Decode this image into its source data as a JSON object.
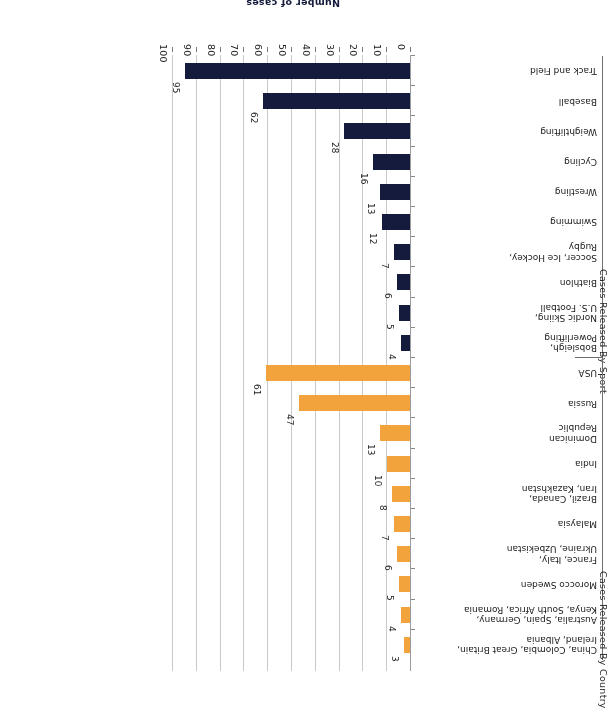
{
  "axis": {
    "value_axis_title": "Number of cases",
    "value_ticks": [
      "0",
      "10",
      "20",
      "30",
      "40",
      "50",
      "60",
      "70",
      "80",
      "90",
      "100"
    ],
    "value_min": 0,
    "value_max": 100
  },
  "groups": [
    {
      "id": "sport",
      "title": "Cases Released By Sport",
      "color": "#141b3c"
    },
    {
      "id": "country",
      "title": "Cases Released By Country",
      "color": "#f2a33c"
    }
  ],
  "chart_data": {
    "type": "bar",
    "orientation": "horizontal",
    "title": "",
    "xlabel": "Number of cases",
    "ylabel": "",
    "xlim": [
      0,
      100
    ],
    "grid": true,
    "legend": "none",
    "tick_labels": [
      "0",
      "10",
      "20",
      "30",
      "40",
      "50",
      "60",
      "70",
      "80",
      "90",
      "100"
    ],
    "series": [
      {
        "name": "Cases Released By Sport",
        "color": "#141b3c",
        "categories": [
          "Track and Field",
          "Baseball",
          "Weightlifting",
          "Cycling",
          "Wrestling",
          "Swimming",
          "Soccer, Ice Hockey,\nRugby",
          "Biathlon",
          "Nordic Skiing,\nU.S. Football",
          "Bobsleigh,\nPowerlifting"
        ],
        "values": [
          95,
          62,
          28,
          16,
          13,
          12,
          7,
          6,
          5,
          4
        ],
        "labels": [
          "95",
          "62",
          "28",
          "16",
          "13",
          "12",
          "7",
          "6",
          "5",
          "4"
        ]
      },
      {
        "name": "Cases Released By Country",
        "color": "#f2a33c",
        "categories": [
          "USA",
          "Russia",
          "Dominican\nRepublic",
          "India",
          "Brazil, Canada,\nIran, Kazakhstan",
          "Malaysia",
          "France, Italy,\nUkraine, Uzbekistan",
          "Morocco Sweden",
          "Australia, Spain, Germany,\nKenya, South Africa, Romania",
          "China, Colombia, Great Britain,\nIreland, Albania"
        ],
        "values": [
          61,
          47,
          13,
          10,
          8,
          7,
          6,
          5,
          4,
          3
        ],
        "labels": [
          "61",
          "47",
          "13",
          "10",
          "8",
          "7",
          "6",
          "5",
          "4",
          "3"
        ]
      }
    ]
  }
}
